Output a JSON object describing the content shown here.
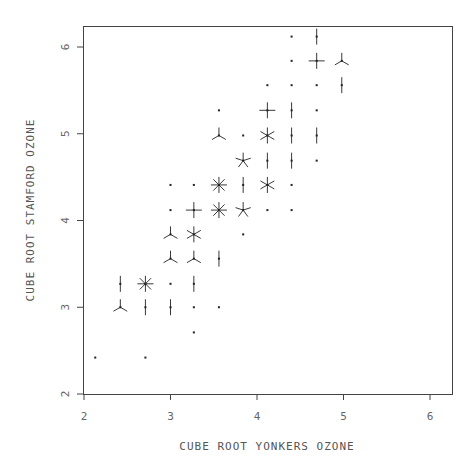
{
  "chart_data": {
    "type": "scatter",
    "subtype": "sunflower",
    "title": "",
    "xlabel": "CUBE ROOT YONKERS OZONE",
    "ylabel": "CUBE ROOT STAMFORD OZONE",
    "xlim": [
      2,
      6.25
    ],
    "ylim": [
      2,
      6.25
    ],
    "xticks": [
      "2",
      "3",
      "4",
      "5",
      "6"
    ],
    "yticks": [
      "2",
      "3",
      "4",
      "5",
      "6"
    ],
    "grid": false,
    "legend": null,
    "points": [
      {
        "x": 2.13,
        "y": 2.42,
        "count": 1
      },
      {
        "x": 2.71,
        "y": 2.42,
        "count": 1
      },
      {
        "x": 3.27,
        "y": 2.71,
        "count": 1
      },
      {
        "x": 2.42,
        "y": 3.0,
        "count": 3
      },
      {
        "x": 2.71,
        "y": 3.0,
        "count": 2
      },
      {
        "x": 3.0,
        "y": 3.0,
        "count": 2
      },
      {
        "x": 3.27,
        "y": 3.0,
        "count": 1
      },
      {
        "x": 3.56,
        "y": 3.0,
        "count": 1
      },
      {
        "x": 2.42,
        "y": 3.27,
        "count": 2
      },
      {
        "x": 2.71,
        "y": 3.27,
        "count": 8
      },
      {
        "x": 3.0,
        "y": 3.27,
        "count": 1
      },
      {
        "x": 3.27,
        "y": 3.27,
        "count": 2
      },
      {
        "x": 3.0,
        "y": 3.56,
        "count": 3
      },
      {
        "x": 3.27,
        "y": 3.56,
        "count": 3
      },
      {
        "x": 3.56,
        "y": 3.56,
        "count": 2
      },
      {
        "x": 3.0,
        "y": 3.84,
        "count": 3
      },
      {
        "x": 3.27,
        "y": 3.84,
        "count": 6
      },
      {
        "x": 3.84,
        "y": 3.84,
        "count": 1
      },
      {
        "x": 3.0,
        "y": 4.12,
        "count": 1
      },
      {
        "x": 3.27,
        "y": 4.12,
        "count": 4
      },
      {
        "x": 3.56,
        "y": 4.12,
        "count": 8
      },
      {
        "x": 3.84,
        "y": 4.12,
        "count": 5
      },
      {
        "x": 4.12,
        "y": 4.12,
        "count": 1
      },
      {
        "x": 4.4,
        "y": 4.12,
        "count": 1
      },
      {
        "x": 3.0,
        "y": 4.41,
        "count": 1
      },
      {
        "x": 3.27,
        "y": 4.41,
        "count": 1
      },
      {
        "x": 3.56,
        "y": 4.41,
        "count": 8
      },
      {
        "x": 3.84,
        "y": 4.41,
        "count": 2
      },
      {
        "x": 4.12,
        "y": 4.41,
        "count": 6
      },
      {
        "x": 4.4,
        "y": 4.41,
        "count": 1
      },
      {
        "x": 3.84,
        "y": 4.69,
        "count": 5
      },
      {
        "x": 4.12,
        "y": 4.69,
        "count": 2
      },
      {
        "x": 4.4,
        "y": 4.69,
        "count": 2
      },
      {
        "x": 4.69,
        "y": 4.69,
        "count": 1
      },
      {
        "x": 3.56,
        "y": 4.98,
        "count": 3
      },
      {
        "x": 3.84,
        "y": 4.98,
        "count": 1
      },
      {
        "x": 4.12,
        "y": 4.98,
        "count": 6
      },
      {
        "x": 4.4,
        "y": 4.98,
        "count": 2
      },
      {
        "x": 4.69,
        "y": 4.98,
        "count": 2
      },
      {
        "x": 3.56,
        "y": 5.27,
        "count": 1
      },
      {
        "x": 4.12,
        "y": 5.27,
        "count": 4
      },
      {
        "x": 4.4,
        "y": 5.27,
        "count": 2
      },
      {
        "x": 4.69,
        "y": 5.27,
        "count": 1
      },
      {
        "x": 4.12,
        "y": 5.56,
        "count": 1
      },
      {
        "x": 4.4,
        "y": 5.56,
        "count": 1
      },
      {
        "x": 4.69,
        "y": 5.56,
        "count": 1
      },
      {
        "x": 4.98,
        "y": 5.56,
        "count": 2
      },
      {
        "x": 4.4,
        "y": 5.84,
        "count": 1
      },
      {
        "x": 4.69,
        "y": 5.84,
        "count": 4
      },
      {
        "x": 4.98,
        "y": 5.84,
        "count": 3
      },
      {
        "x": 4.4,
        "y": 6.12,
        "count": 1
      },
      {
        "x": 4.69,
        "y": 6.12,
        "count": 2
      }
    ]
  },
  "style": {
    "frame_color": "#333333",
    "marker_color": "#222222",
    "label_color": "#666666"
  }
}
